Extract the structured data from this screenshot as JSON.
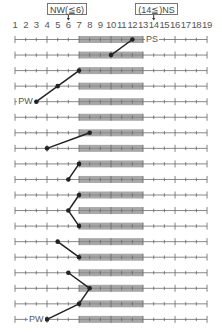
{
  "annotations": {
    "left_box": {
      "text": "NW(≦6)",
      "points_to": 6
    },
    "right_box": {
      "text": "(14≦)NS",
      "points_to": 14
    }
  },
  "axis": {
    "ticks": [
      "1",
      "2",
      "3",
      "4",
      "5",
      "6",
      "7",
      "8",
      "9",
      "10",
      "11",
      "12",
      "13",
      "14",
      "15",
      "16",
      "17",
      "18",
      "19"
    ],
    "min": 1,
    "max": 19,
    "shaded_range": [
      7,
      13
    ]
  },
  "labels": {
    "ps": "PS",
    "pw": "PW"
  },
  "rows": [
    {
      "index": 1,
      "dot": 12,
      "label": "PS",
      "label_side": "right"
    },
    {
      "index": 2,
      "dot": 10
    },
    {
      "index": 3,
      "dot": 7
    },
    {
      "index": 4,
      "dot": 5
    },
    {
      "index": 5,
      "dot": 3,
      "label": "PW",
      "label_side": "left"
    },
    {
      "index": 6,
      "dot": null
    },
    {
      "index": 7,
      "dot": 8
    },
    {
      "index": 8,
      "dot": 4
    },
    {
      "index": 9,
      "dot": 7
    },
    {
      "index": 10,
      "dot": 6
    },
    {
      "index": 11,
      "dot": 7
    },
    {
      "index": 12,
      "dot": 6
    },
    {
      "index": 13,
      "dot": 7
    },
    {
      "index": 14,
      "dot": 5
    },
    {
      "index": 15,
      "dot": 7
    },
    {
      "index": 16,
      "dot": 6
    },
    {
      "index": 17,
      "dot": 8
    },
    {
      "index": 18,
      "dot": 7
    },
    {
      "index": 19,
      "dot": 4,
      "label": "PW",
      "label_side": "left"
    }
  ],
  "connections": [
    [
      1,
      2
    ],
    [
      3,
      4
    ],
    [
      4,
      5
    ],
    [
      7,
      8
    ],
    [
      9,
      10
    ],
    [
      11,
      12
    ],
    [
      12,
      13
    ],
    [
      14,
      15
    ],
    [
      16,
      17
    ],
    [
      17,
      18
    ],
    [
      18,
      19
    ]
  ],
  "colors": {
    "line": "#888888",
    "shade": "#a8a8a8",
    "dot": "#222222",
    "connector": "#222222",
    "text": "#555555"
  }
}
